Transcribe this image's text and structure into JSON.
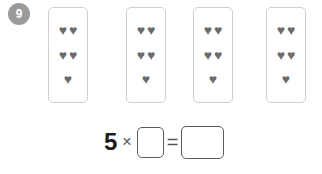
{
  "exercise": {
    "number": "9",
    "badge_color": "#9a9a9a",
    "background_color": "#ffffff"
  },
  "cards": {
    "count": 4,
    "hearts_per_card": 5,
    "heart_symbol": "♥",
    "heart_color": "#6b6b6b",
    "border_color": "#cfcfcf",
    "items": [
      {
        "rows": [
          2,
          2,
          1
        ]
      },
      {
        "rows": [
          2,
          2,
          1
        ]
      },
      {
        "rows": [
          2,
          2,
          1
        ]
      },
      {
        "rows": [
          2,
          2,
          1
        ]
      }
    ]
  },
  "equation": {
    "multiplier": "5",
    "times_symbol": "×",
    "equals_symbol": "=",
    "factor_box_value": "",
    "product_box_value": "",
    "box_border_color": "#5c5c5c"
  }
}
